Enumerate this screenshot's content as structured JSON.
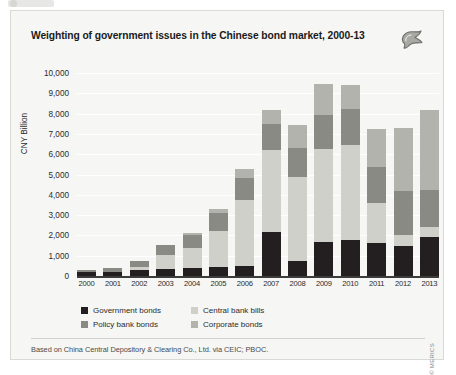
{
  "figure": {
    "title": "Weighting of government issues in the Chinese bond market, 2000-13",
    "logo_name": "merics-logo",
    "footer": "Based on China Central Depository & Clearing Co., Ltd. via CEIC; PBOC.",
    "credit": "© MERICS"
  },
  "chart_data": {
    "type": "bar",
    "stacked": true,
    "title": "Weighting of government issues in the Chinese bond market, 2000-13",
    "xlabel": "",
    "ylabel": "CNY Billion",
    "ylim": [
      0,
      10000
    ],
    "ytick_step": 1000,
    "yticks": [
      "0",
      "1,000",
      "2,000",
      "3,000",
      "4,000",
      "5,000",
      "6,000",
      "7,000",
      "8,000",
      "9,000",
      "10,000"
    ],
    "grid": true,
    "legend_position": "bottom-left",
    "categories": [
      "2000",
      "2001",
      "2002",
      "2003",
      "2004",
      "2005",
      "2006",
      "2007",
      "2008",
      "2009",
      "2010",
      "2011",
      "2012",
      "2013"
    ],
    "series": [
      {
        "name": "Government bonds",
        "color": "#231f20",
        "values": [
          180,
          220,
          320,
          360,
          380,
          450,
          500,
          2150,
          720,
          1700,
          1750,
          1650,
          1500,
          1900
        ]
      },
      {
        "name": "Central bank bills",
        "color": "#d0d0cb",
        "values": [
          0,
          0,
          120,
          680,
          1000,
          1750,
          3250,
          4050,
          4150,
          4550,
          4700,
          1950,
          530,
          530
        ]
      },
      {
        "name": "Policy bank bonds",
        "color": "#8a8a85",
        "values": [
          120,
          160,
          280,
          500,
          650,
          900,
          1100,
          1300,
          1450,
          1700,
          1800,
          1750,
          2150,
          1800
        ]
      },
      {
        "name": "Corporate bonds",
        "color": "#b3b3ae",
        "values": [
          0,
          0,
          0,
          0,
          100,
          200,
          400,
          700,
          1100,
          1500,
          1150,
          1900,
          3100,
          3950
        ]
      }
    ],
    "totals": [
      300,
      380,
      720,
      1540,
      2130,
      3300,
      5250,
      8200,
      7420,
      9450,
      9400,
      7250,
      7280,
      8180
    ]
  },
  "legend": {
    "items": [
      {
        "label": "Government bonds",
        "color": "#231f20",
        "name": "legend-government-bonds"
      },
      {
        "label": "Central bank bills",
        "color": "#d0d0cb",
        "name": "legend-central-bank-bills"
      },
      {
        "label": "Policy bank bonds",
        "color": "#8a8a85",
        "name": "legend-policy-bank-bonds"
      },
      {
        "label": "Corporate bonds",
        "color": "#b3b3ae",
        "name": "legend-corporate-bonds"
      }
    ]
  }
}
